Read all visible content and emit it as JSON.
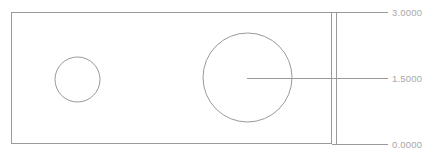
{
  "drawing": {
    "type": "cad-technical-drawing",
    "background_color": "#ffffff",
    "line_color": "#9a9a9a",
    "text_color": "#a8a8a8",
    "part": {
      "name": "rectangular-plate",
      "shape": "rectangle",
      "x": 11,
      "y": 12,
      "width": 321,
      "height": 132
    },
    "features": [
      {
        "name": "small-hole",
        "shape": "circle",
        "cx": 77.5,
        "cy": 79.5,
        "r": 22.5
      },
      {
        "name": "large-hole",
        "shape": "circle",
        "cx": 247.5,
        "cy": 77.5,
        "r": 44.5
      }
    ],
    "dimensions": [
      {
        "id": "top",
        "value": "3.0000",
        "leader_y": 12,
        "leader_x1": 332,
        "leader_x2": 388
      },
      {
        "id": "middle",
        "value": "1.5000",
        "leader_y": 78,
        "leader_x1": 247,
        "leader_x2": 388
      },
      {
        "id": "bottom",
        "value": "0.0000",
        "leader_y": 144,
        "leader_x1": 332,
        "leader_x2": 388
      }
    ],
    "extension_line": {
      "name": "vertical-extension-line",
      "x": 336,
      "y1": 12,
      "y2": 144
    }
  }
}
